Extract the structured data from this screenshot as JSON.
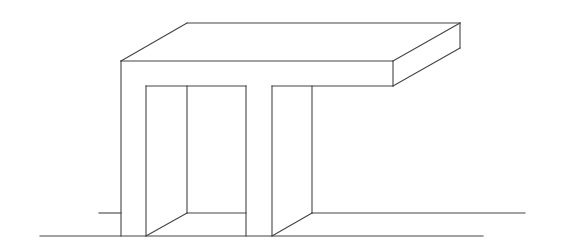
{
  "diagram": {
    "stroke_color": "#444444",
    "background": "#ffffff",
    "lines": [
      {
        "name": "ground-front",
        "x1": 40,
        "y1": 236,
        "x2": 483,
        "y2": 236
      },
      {
        "name": "ground-back-left",
        "x1": 99,
        "y1": 213,
        "x2": 121,
        "y2": 213
      },
      {
        "name": "ground-back-middle",
        "x1": 187,
        "y1": 213,
        "x2": 246,
        "y2": 213
      },
      {
        "name": "ground-back-right",
        "x1": 312,
        "y1": 213,
        "x2": 525,
        "y2": 213
      },
      {
        "name": "top-back-edge",
        "x1": 187,
        "y1": 23,
        "x2": 460,
        "y2": 23
      },
      {
        "name": "top-left-diagonal",
        "x1": 121,
        "y1": 61,
        "x2": 187,
        "y2": 23
      },
      {
        "name": "top-right-diagonal",
        "x1": 393,
        "y1": 61,
        "x2": 460,
        "y2": 23
      },
      {
        "name": "top-front-edge",
        "x1": 121,
        "y1": 61,
        "x2": 393,
        "y2": 61
      },
      {
        "name": "slab-right-front-vertical",
        "x1": 393,
        "y1": 61,
        "x2": 393,
        "y2": 86
      },
      {
        "name": "slab-right-back-vertical",
        "x1": 460,
        "y1": 23,
        "x2": 460,
        "y2": 48
      },
      {
        "name": "slab-right-bottom-diagonal",
        "x1": 393,
        "y1": 86,
        "x2": 460,
        "y2": 48
      },
      {
        "name": "slab-bottom-front-right",
        "x1": 272,
        "y1": 86,
        "x2": 393,
        "y2": 86
      },
      {
        "name": "left-leg-outer",
        "x1": 121,
        "y1": 61,
        "x2": 121,
        "y2": 236
      },
      {
        "name": "opening-top",
        "x1": 146,
        "y1": 86,
        "x2": 246,
        "y2": 86
      },
      {
        "name": "opening-left",
        "x1": 146,
        "y1": 86,
        "x2": 146,
        "y2": 236
      },
      {
        "name": "opening-inner-back",
        "x1": 187,
        "y1": 86,
        "x2": 187,
        "y2": 213
      },
      {
        "name": "opening-diagonal",
        "x1": 146,
        "y1": 236,
        "x2": 187,
        "y2": 213
      },
      {
        "name": "middle-leg-left",
        "x1": 246,
        "y1": 86,
        "x2": 246,
        "y2": 236
      },
      {
        "name": "right-leg-left",
        "x1": 272,
        "y1": 86,
        "x2": 272,
        "y2": 236
      },
      {
        "name": "right-leg-inner-back",
        "x1": 312,
        "y1": 86,
        "x2": 312,
        "y2": 213
      },
      {
        "name": "right-leg-diagonal",
        "x1": 272,
        "y1": 236,
        "x2": 312,
        "y2": 213
      }
    ]
  }
}
